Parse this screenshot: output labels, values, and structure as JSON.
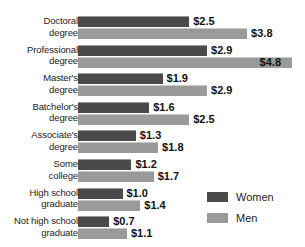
{
  "chart_data": {
    "type": "bar",
    "orientation": "horizontal",
    "title": "",
    "subtitle": "",
    "xlabel": "",
    "ylabel": "",
    "grid": false,
    "legend_position": "bottom-right",
    "xlim": [
      0,
      4.8
    ],
    "categories": [
      "Doctoral degree",
      "Professional degree",
      "Master's degree",
      "Batchelor's degree",
      "Associate's degree",
      "Some college",
      "High school graduate",
      "Not high school graduate"
    ],
    "category_lines": [
      [
        "Doctoral",
        "degree"
      ],
      [
        "Professional",
        "degree"
      ],
      [
        "Master's",
        "degree"
      ],
      [
        "Batchelor's",
        "degree"
      ],
      [
        "Associate's",
        "degree"
      ],
      [
        "Some",
        "college"
      ],
      [
        "High school",
        "graduate"
      ],
      [
        "Not high school",
        "graduate"
      ]
    ],
    "series": [
      {
        "name": "Women",
        "color": "#4a4a4a",
        "values": [
          2.5,
          2.9,
          1.9,
          1.6,
          1.3,
          1.2,
          1.0,
          0.7
        ],
        "labels": [
          "$2.5",
          "$2.9",
          "$1.9",
          "$1.6",
          "$1.3",
          "$1.2",
          "$1.0",
          "$0.7"
        ]
      },
      {
        "name": "Men",
        "color": "#9a9a9a",
        "values": [
          3.8,
          4.8,
          2.9,
          2.5,
          1.8,
          1.7,
          1.4,
          1.1
        ],
        "labels": [
          "$3.8",
          "$4.8",
          "$2.9",
          "$2.5",
          "$1.8",
          "$1.7",
          "$1.4",
          "$1.1"
        ]
      }
    ]
  },
  "legend": {
    "entries": [
      {
        "label": "Women",
        "color": "#4a4a4a"
      },
      {
        "label": "Men",
        "color": "#9a9a9a"
      }
    ]
  },
  "colors": {
    "women": "#4a4a4a",
    "men": "#9a9a9a",
    "background": "#ffffff",
    "text": "#1c1c1c"
  }
}
